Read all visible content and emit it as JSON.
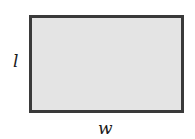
{
  "diagram": {
    "shape": "rectangle",
    "fill_color": "#e4e4e4",
    "border_color": "#3a3a3a",
    "labels": {
      "length": "l",
      "width": "w"
    }
  }
}
